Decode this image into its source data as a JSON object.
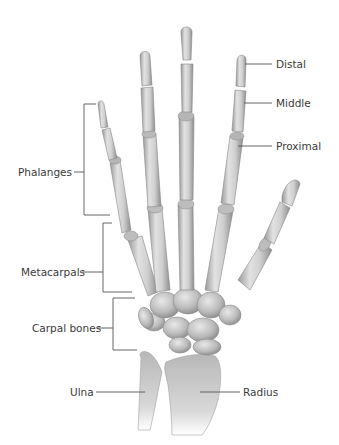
{
  "diagram": {
    "labels": {
      "distal": "Distal",
      "middle": "Middle",
      "proximal": "Proximal",
      "phalanges": "Phalanges",
      "metacarpals": "Metacarpals",
      "carpal_bones": "Carpal bones",
      "ulna": "Ulna",
      "radius": "Radius"
    },
    "colors": {
      "background": "#ffffff",
      "bone_light": "#e4e4e4",
      "bone_mid": "#bdbdbd",
      "bone_dark": "#8c8c8c",
      "leader_line": "#555555",
      "text": "#3a3a3a"
    }
  }
}
